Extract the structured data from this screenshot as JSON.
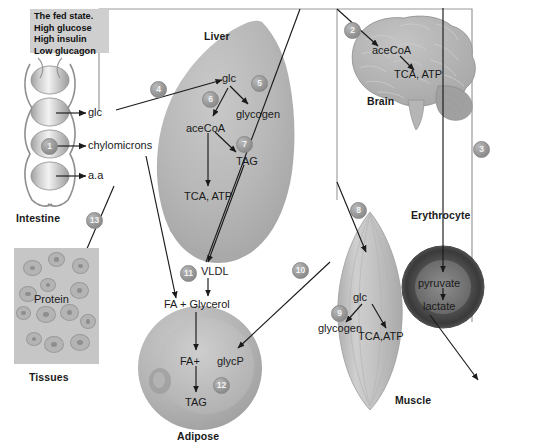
{
  "figure": {
    "title_box": {
      "lines": [
        "The fed state.",
        "High glucose",
        "High insulin",
        "Low glucagon"
      ],
      "bg": "#cfcfcf"
    },
    "frame": {
      "border_color": "#8f8f8f"
    }
  },
  "organs": {
    "intestine": {
      "label": "Intestine",
      "marker": "1",
      "outputs": [
        "glc",
        "chylomicrons",
        "a.a"
      ]
    },
    "liver": {
      "label": "Liver",
      "markers": [
        "4",
        "5",
        "6",
        "7"
      ],
      "metabolites": [
        "glc",
        "glycogen",
        "aceCoA",
        "TAG",
        "TCA, ATP"
      ]
    },
    "brain": {
      "label": "Brain",
      "marker": "2",
      "metabolites": [
        "aceCoA",
        "TCA, ATP"
      ]
    },
    "erythrocyte": {
      "label": "Erythrocyte",
      "marker": "3",
      "metabolites": [
        "pyruvate",
        "lactate"
      ]
    },
    "muscle": {
      "label": "Muscle",
      "markers": [
        "8",
        "9"
      ],
      "metabolites": [
        "glc",
        "glycogen",
        "TCA,ATP"
      ]
    },
    "adipose": {
      "label": "Adipose",
      "markers": [
        "10",
        "11",
        "12"
      ],
      "metabolites": [
        "VLDL",
        "FA + Glycerol",
        "FA+",
        "glycP",
        "TAG"
      ]
    },
    "tissues": {
      "label": "Tissues",
      "marker": "13",
      "metabolites": [
        "Protein"
      ]
    }
  },
  "labels": {
    "glc_intestine": "glc",
    "chylomicrons": "chylomicrons",
    "aa": "a.a",
    "liver_title": "Liver",
    "liver_glc": "glc",
    "liver_glycogen": "glycogen",
    "liver_acecoa": "aceCoA",
    "liver_tag": "TAG",
    "liver_tca": "TCA, ATP",
    "brain_title": "Brain",
    "brain_acecoa": "aceCoA",
    "brain_tca": "TCA, ATP",
    "ery_title": "Erythrocyte",
    "ery_pyruvate": "pyruvate",
    "ery_lactate": "lactate",
    "muscle_title": "Muscle",
    "muscle_glc": "glc",
    "muscle_glycogen": "glycogen",
    "muscle_tca": "TCA,ATP",
    "adipose_title": "Adipose",
    "vldl": "VLDL",
    "fa_glycerol": "FA + Glycerol",
    "fa_plus": "FA+",
    "glycp": "glycP",
    "adipose_tag": "TAG",
    "tissues_title": "Tissues",
    "protein": "Protein",
    "intestine_title": "Intestine"
  },
  "markers": {
    "m1": "1",
    "m2": "2",
    "m3": "3",
    "m4": "4",
    "m5": "5",
    "m6": "6",
    "m7": "7",
    "m8": "8",
    "m9": "9",
    "m10": "10",
    "m11": "11",
    "m12": "12",
    "m13": "13"
  }
}
